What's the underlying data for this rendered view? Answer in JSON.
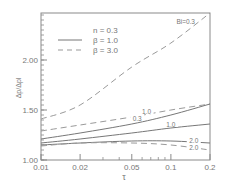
{
  "chart_data": {
    "type": "line",
    "title": "",
    "xlabel": "τ",
    "ylabel": "Δp/Δpl",
    "xscale": "log",
    "xlim": [
      0.01,
      0.2
    ],
    "ylim": [
      1.0,
      2.47
    ],
    "x_ticks": [
      0.01,
      0.02,
      0.05,
      0.1,
      0.2
    ],
    "x_tick_labels": [
      "0.01",
      "0.02",
      "0.05",
      "0.1",
      "0.2"
    ],
    "y_ticks": [
      1.0,
      1.5,
      2.0
    ],
    "y_tick_labels": [
      "1.00",
      "1.50",
      "2.00"
    ],
    "grid": false,
    "legend": {
      "position": "upper-left",
      "header": "n = 0.3",
      "entries": [
        {
          "label": "β = 1.0",
          "style": "solid"
        },
        {
          "label": "β = 3.0",
          "style": "dashed"
        }
      ]
    },
    "x": [
      0.01,
      0.02,
      0.05,
      0.1,
      0.2
    ],
    "series": [
      {
        "name": "β = 3.0, Bi = 0.3",
        "style": "dashed",
        "label": "Bi=0.3",
        "values": [
          1.41,
          1.55,
          1.93,
          2.17,
          2.47
        ]
      },
      {
        "name": "β = 3.0, Bi = 1.0",
        "style": "dashed",
        "label": "1.0",
        "values": [
          1.29,
          1.35,
          1.43,
          1.5,
          1.56
        ]
      },
      {
        "name": "β = 1.0, Bi = 0.3",
        "style": "solid",
        "label": "0.3",
        "values": [
          1.21,
          1.27,
          1.36,
          1.45,
          1.56
        ]
      },
      {
        "name": "β = 1.0, Bi = 1.0",
        "style": "solid",
        "label": "1.0",
        "values": [
          1.17,
          1.21,
          1.27,
          1.32,
          1.36
        ]
      },
      {
        "name": "β = 1.0, Bi = 2.0",
        "style": "solid",
        "label": "2.0",
        "values": [
          1.15,
          1.17,
          1.19,
          1.19,
          1.17
        ]
      },
      {
        "name": "β = 3.0, Bi = 2.0",
        "style": "dashed",
        "label": "2.0",
        "values": [
          1.14,
          1.17,
          1.17,
          1.15,
          1.1
        ]
      }
    ],
    "annotations": [
      {
        "text": "Bi=0.3",
        "x": 0.13,
        "y": 2.38
      },
      {
        "text": "1.0",
        "x": 0.065,
        "y": 1.48
      },
      {
        "text": "0.3",
        "x": 0.055,
        "y": 1.41
      },
      {
        "text": "1.0",
        "x": 0.1,
        "y": 1.35
      },
      {
        "text": "2.0",
        "x": 0.15,
        "y": 1.19
      },
      {
        "text": "2.0",
        "x": 0.15,
        "y": 1.12
      }
    ]
  }
}
